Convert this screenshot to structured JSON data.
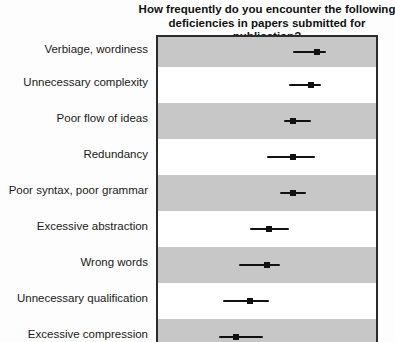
{
  "figure": {
    "title_line1": "How frequently do you encounter the following",
    "title_line2": "deficiencies in papers submitted for publication?"
  },
  "colors": {
    "band_gray": "#c7c7c7",
    "band_white": "#ffffff",
    "plot_border": "#2b2b2b",
    "marker": "#111111",
    "error_bar": "#111111",
    "text": "#1a1a1a"
  },
  "chart_data": {
    "type": "scatter",
    "subtype": "horizontal-dot-plot-with-error-bars",
    "title": "How frequently do you encounter the following deficiencies in papers submitted for publication?",
    "categories": [
      "Verbiage, wordiness",
      "Unnecessary complexity",
      "Poor flow of ideas",
      "Redundancy",
      "Poor syntax, poor grammar",
      "Excessive abstraction",
      "Wrong words",
      "Unnecessary qualification",
      "Excessive compression"
    ],
    "series": [
      {
        "name": "mean frequency (square marker)",
        "values": [
          0.73,
          0.7,
          0.62,
          0.62,
          0.62,
          0.51,
          0.5,
          0.42,
          0.36
        ],
        "error_low": [
          0.62,
          0.6,
          0.58,
          0.5,
          0.56,
          0.42,
          0.37,
          0.3,
          0.28
        ],
        "error_high": [
          0.77,
          0.75,
          0.7,
          0.72,
          0.68,
          0.6,
          0.56,
          0.51,
          0.48
        ]
      }
    ],
    "x_axis_visible": false,
    "value_scale": "fraction of visible plot width (axis tick labels cropped out of image)",
    "row_shading_first": "gray",
    "legend": "none",
    "grid": "off"
  }
}
